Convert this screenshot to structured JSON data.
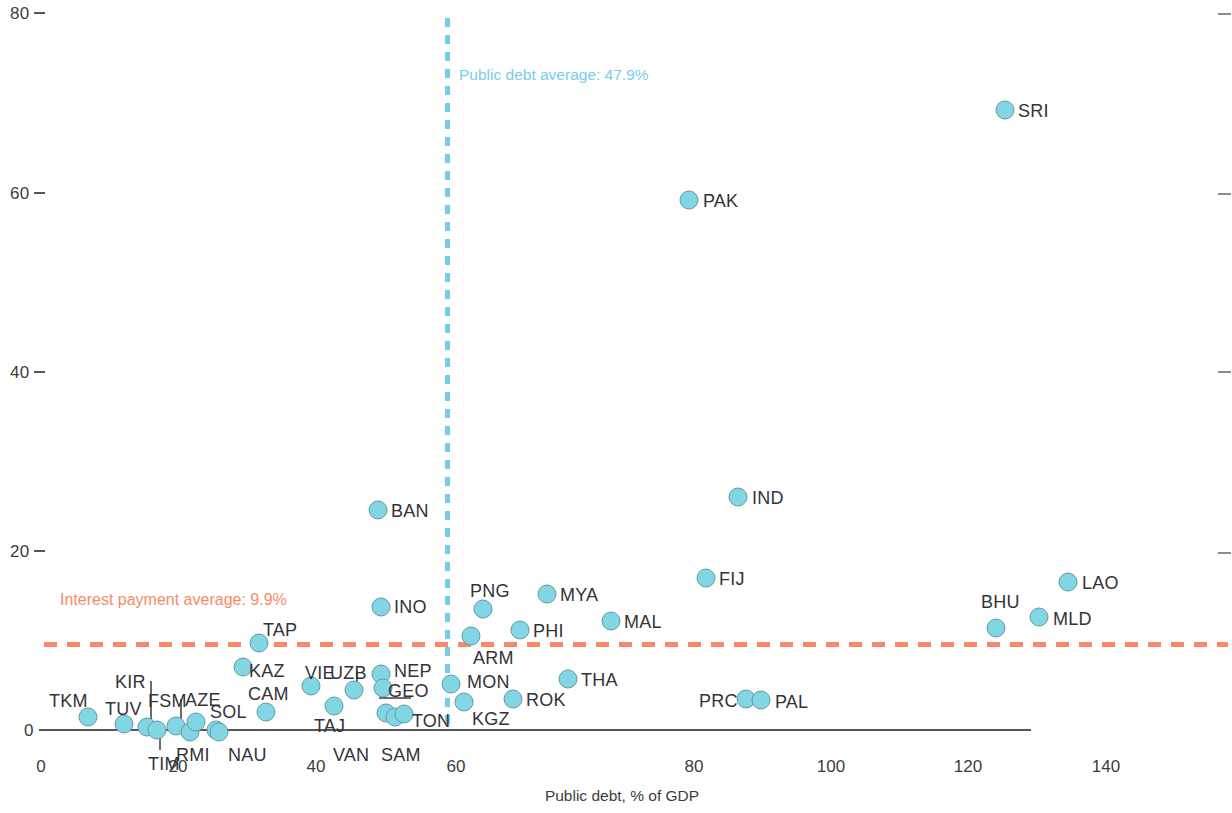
{
  "chart_data": {
    "type": "scatter",
    "title": "",
    "xlabel": "Public debt, % of GDP",
    "ylabel": "",
    "xlim": [
      0,
      140
    ],
    "ylim": [
      0,
      80
    ],
    "xticks": [
      "0",
      "20",
      "40",
      "60",
      "80",
      "100",
      "120",
      "140"
    ],
    "yticks": [
      "0",
      "20",
      "40",
      "60",
      "80"
    ],
    "grid": false,
    "legend": "none",
    "marker_color": "#82d6e3",
    "marker_border_color": "#5f9ba6",
    "reference_lines": [
      {
        "name": "public-debt-average",
        "orientation": "vertical",
        "value": 47.9,
        "label": "Public debt average: 47.9%",
        "color": "#74cdec",
        "style": "dashed"
      },
      {
        "name": "interest-payment-average",
        "orientation": "horizontal",
        "value": 9.9,
        "label": "Interest payment average: 9.9%",
        "color": "#fa8768",
        "style": "dashed"
      }
    ],
    "points": [
      {
        "label": "TKM",
        "x": 6.8,
        "y": 1.3
      },
      {
        "label": "TUV",
        "x": 11.9,
        "y": 0.5
      },
      {
        "label": "KIR",
        "x": 15.1,
        "y": 0.1
      },
      {
        "label": "TIM",
        "x": 16.6,
        "y": 0.0
      },
      {
        "label": "FSM",
        "x": 19.2,
        "y": 0.4
      },
      {
        "label": "RMI",
        "x": 21.7,
        "y": -0.3
      },
      {
        "label": "AZE",
        "x": 22.5,
        "y": 0.8
      },
      {
        "label": "SOL",
        "x": 25.4,
        "y": 0.0
      },
      {
        "label": "NAU",
        "x": 25.8,
        "y": -0.3
      },
      {
        "label": "KAZ",
        "x": 29.3,
        "y": 7.0
      },
      {
        "label": "TAP",
        "x": 31.7,
        "y": 9.7
      },
      {
        "label": "CAM",
        "x": 32.6,
        "y": 2.0
      },
      {
        "label": "VIE",
        "x": 39.2,
        "y": 2.7
      },
      {
        "label": "TAJ",
        "x": 42.5,
        "y": 4.9
      },
      {
        "label": "UZB",
        "x": 45.5,
        "y": 4.4
      },
      {
        "label": "NEP",
        "x": 49.4,
        "y": 6.2
      },
      {
        "label": "GEO",
        "x": 49.8,
        "y": 4.6
      },
      {
        "label": "VAN",
        "x": 50.1,
        "y": 1.9
      },
      {
        "label": "SAM",
        "x": 51.4,
        "y": 1.3
      },
      {
        "label": "TON",
        "x": 52.8,
        "y": 1.7
      },
      {
        "label": "BAN",
        "x": 48.9,
        "y": 24.4
      },
      {
        "label": "INO",
        "x": 49.3,
        "y": 13.7
      },
      {
        "label": "MON",
        "x": 59.6,
        "y": 5.0
      },
      {
        "label": "KGZ",
        "x": 61.5,
        "y": 3.0
      },
      {
        "label": "ARM",
        "x": 62.6,
        "y": 10.3
      },
      {
        "label": "PNG",
        "x": 64.3,
        "y": 13.3
      },
      {
        "label": "PHI",
        "x": 69.7,
        "y": 11.0
      },
      {
        "label": "ROK",
        "x": 68.8,
        "y": 3.2
      },
      {
        "label": "MYA",
        "x": 73.6,
        "y": 14.9
      },
      {
        "label": "THA",
        "x": 76.7,
        "y": 5.4
      },
      {
        "label": "MAL",
        "x": 83.0,
        "y": 11.9
      },
      {
        "label": "FIJ",
        "x": 96.8,
        "y": 16.8
      },
      {
        "label": "PRC",
        "x": 102.6,
        "y": 3.4
      },
      {
        "label": "PAL",
        "x": 105.1,
        "y": 3.3
      },
      {
        "label": "IND",
        "x": 101.5,
        "y": 25.7
      },
      {
        "label": "PAK",
        "x": 94.3,
        "y": 59.0
      },
      {
        "label": "SRI",
        "x": 140.4,
        "y": 68.9
      },
      {
        "label": "BHU",
        "x": 139.2,
        "y": 11.2
      },
      {
        "label": "MLD",
        "x": 145.3,
        "y": 12.3
      },
      {
        "label": "LAO",
        "x": 149.5,
        "y": 16.2
      }
    ]
  },
  "axis": {
    "y_labels": [
      {
        "text": "80",
        "top": 4
      },
      {
        "text": "60",
        "top": 184
      },
      {
        "text": "40",
        "top": 363
      },
      {
        "text": "20",
        "top": 542
      },
      {
        "text": "0",
        "top": 721
      }
    ],
    "y_right_ticks": [
      13,
      193,
      371,
      552
    ],
    "x_labels": [
      {
        "text": "0",
        "left": 41
      },
      {
        "text": "20",
        "left": 178
      },
      {
        "text": "40",
        "left": 316
      },
      {
        "text": "60",
        "left": 456
      },
      {
        "text": "80",
        "left": 694
      },
      {
        "text": "100",
        "left": 831
      },
      {
        "text": "120",
        "left": 968
      },
      {
        "text": "140",
        "left": 1106
      }
    ],
    "x_title": "Public debt, % of GDP"
  },
  "markers": [
    {
      "name": "TKM",
      "cx": 88,
      "cy": 717,
      "lx": 49,
      "ly": 691,
      "leader": null
    },
    {
      "name": "TUV",
      "cx": 124,
      "cy": 724,
      "lx": 105,
      "ly": 699,
      "leader": null
    },
    {
      "name": "KIR",
      "cx": 147,
      "cy": 727,
      "lx": 115,
      "ly": 672,
      "leader": {
        "x": 150,
        "y": 681,
        "w": 1.6,
        "h": 38
      }
    },
    {
      "name": "TIM",
      "cx": 157,
      "cy": 730,
      "lx": 148,
      "ly": 754,
      "leader": {
        "x": 159,
        "y": 733,
        "w": 1.6,
        "h": 17
      }
    },
    {
      "name": "FSM",
      "cx": 176,
      "cy": 726,
      "lx": 148,
      "ly": 691,
      "leader": {
        "x": 180,
        "y": 699,
        "w": 1.6,
        "h": 20
      }
    },
    {
      "name": "RMI",
      "cx": 190,
      "cy": 732,
      "lx": 176,
      "ly": 745,
      "leader": null
    },
    {
      "name": "AZE",
      "cx": 196,
      "cy": 722,
      "lx": 185,
      "ly": 690,
      "leader": null
    },
    {
      "name": "SOL",
      "cx": 216,
      "cy": 730,
      "lx": 210,
      "ly": 702,
      "leader": null
    },
    {
      "name": "NAU",
      "cx": 219,
      "cy": 732,
      "lx": 228,
      "ly": 745,
      "leader": null
    },
    {
      "name": "KAZ",
      "cx": 243,
      "cy": 667,
      "lx": 249,
      "ly": 661,
      "leader": null
    },
    {
      "name": "TAP",
      "cx": 259,
      "cy": 643,
      "lx": 263,
      "ly": 620,
      "leader": null
    },
    {
      "name": "CAM",
      "cx": 266,
      "cy": 712,
      "lx": 248,
      "ly": 684,
      "leader": null
    },
    {
      "name": "VIE",
      "cx": 311,
      "cy": 686,
      "lx": 305,
      "ly": 663,
      "leader": null
    },
    {
      "name": "TAJ",
      "cx": 334,
      "cy": 706,
      "lx": 314,
      "ly": 716,
      "leader": null
    },
    {
      "name": "UZB",
      "cx": 354,
      "cy": 690,
      "lx": 330,
      "ly": 663,
      "leader": {
        "x": 356,
        "y": 671,
        "w": 1.6,
        "h": 14
      }
    },
    {
      "name": "NEP",
      "cx": 381,
      "cy": 674,
      "lx": 394,
      "ly": 661,
      "leader": null
    },
    {
      "name": "GEO",
      "cx": 383,
      "cy": 688,
      "lx": 388,
      "ly": 681,
      "leader": null
    },
    {
      "name": "VAN",
      "cx": 386,
      "cy": 713,
      "lx": 333,
      "ly": 745,
      "leader": {
        "x": 379,
        "y": 697,
        "w": 32,
        "h": 1.6
      }
    },
    {
      "name": "SAM",
      "cx": 395,
      "cy": 717,
      "lx": 381,
      "ly": 745,
      "leader": null
    },
    {
      "name": "TON",
      "cx": 404,
      "cy": 714,
      "lx": 412,
      "ly": 711,
      "leader": null
    },
    {
      "name": "BAN",
      "cx": 378,
      "cy": 510,
      "lx": 391,
      "ly": 501,
      "leader": null
    },
    {
      "name": "INO",
      "cx": 381,
      "cy": 607,
      "lx": 394,
      "ly": 597,
      "leader": null
    },
    {
      "name": "MON",
      "cx": 451,
      "cy": 684,
      "lx": 467,
      "ly": 672,
      "leader": null
    },
    {
      "name": "KGZ",
      "cx": 464,
      "cy": 702,
      "lx": 472,
      "ly": 709,
      "leader": null
    },
    {
      "name": "ARM",
      "cx": 471,
      "cy": 636,
      "lx": 473,
      "ly": 648,
      "leader": null
    },
    {
      "name": "PNG",
      "cx": 483,
      "cy": 609,
      "lx": 470,
      "ly": 581,
      "leader": null
    },
    {
      "name": "PHI",
      "cx": 520,
      "cy": 630,
      "lx": 533,
      "ly": 621,
      "leader": null
    },
    {
      "name": "ROK",
      "cx": 513,
      "cy": 699,
      "lx": 526,
      "ly": 690,
      "leader": null
    },
    {
      "name": "MYA",
      "cx": 547,
      "cy": 594,
      "lx": 560,
      "ly": 585,
      "leader": null
    },
    {
      "name": "THA",
      "cx": 568,
      "cy": 679,
      "lx": 581,
      "ly": 670,
      "leader": null
    },
    {
      "name": "MAL",
      "cx": 611,
      "cy": 621,
      "lx": 624,
      "ly": 612,
      "leader": null
    },
    {
      "name": "FIJ",
      "cx": 706,
      "cy": 578,
      "lx": 719,
      "ly": 569,
      "leader": null
    },
    {
      "name": "PRC",
      "cx": 746,
      "cy": 699,
      "lx": 699,
      "ly": 691,
      "leader": null
    },
    {
      "name": "PAL",
      "cx": 761,
      "cy": 700,
      "lx": 775,
      "ly": 692,
      "leader": null
    },
    {
      "name": "IND",
      "cx": 738,
      "cy": 497,
      "lx": 752,
      "ly": 488,
      "leader": null
    },
    {
      "name": "PAK",
      "cx": 689,
      "cy": 200,
      "lx": 703,
      "ly": 191,
      "leader": null
    },
    {
      "name": "SRI",
      "cx": 1005,
      "cy": 110,
      "lx": 1018,
      "ly": 101,
      "leader": null
    },
    {
      "name": "BHU",
      "cx": 996,
      "cy": 628,
      "lx": 981,
      "ly": 592,
      "leader": null
    },
    {
      "name": "MLD",
      "cx": 1039,
      "cy": 617,
      "lx": 1053,
      "ly": 609,
      "leader": null
    },
    {
      "name": "LAO",
      "cx": 1068,
      "cy": 582,
      "lx": 1082,
      "ly": 573,
      "leader": null
    }
  ],
  "reflines": {
    "vertical_left": 445,
    "horizontal_top": 642,
    "vertical_label": "Public debt average: 47.9%",
    "vertical_label_left": 459,
    "vertical_label_top": 66,
    "horizontal_label": "Interest payment average: 9.9%",
    "horizontal_label_left": 60,
    "horizontal_label_top": 591
  }
}
